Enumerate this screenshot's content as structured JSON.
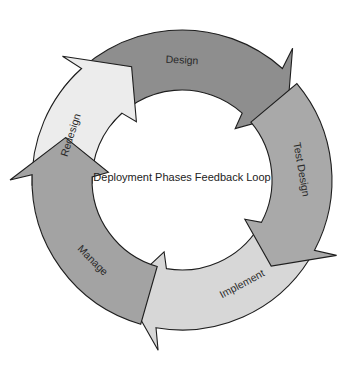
{
  "diagram": {
    "title": "Deployment Phases Feedback Loop",
    "center": {
      "x": 182,
      "y": 180
    },
    "outer_radius": 150,
    "inner_radius": 90,
    "stroke_color": "#1e1e1e",
    "phases": [
      {
        "id": "design",
        "label": "Design",
        "fill": "#8e8e8e",
        "start": -52,
        "end": 42,
        "tip": 58,
        "label_angle": 0,
        "label_rotate": 3
      },
      {
        "id": "test-design",
        "label": "Test Design",
        "fill": "#a9a9a9",
        "start": 50,
        "end": 118,
        "tip": 134,
        "label_angle": 85,
        "label_rotate": 80
      },
      {
        "id": "implement",
        "label": "Implement",
        "fill": "#d7d7d7",
        "start": 122,
        "end": 190,
        "tip": 208,
        "label_angle": 150,
        "label_rotate": -28
      },
      {
        "id": "manage",
        "label": "Manage",
        "fill": "#a3a3a3",
        "start": 196,
        "end": 272,
        "tip": 290,
        "label_angle": 228,
        "label_rotate": 45
      },
      {
        "id": "redesign",
        "label": "Redesign",
        "fill": "#ececec",
        "start": 268,
        "end": 318,
        "tip": 336,
        "label_angle": 292,
        "label_rotate": -72
      }
    ]
  }
}
